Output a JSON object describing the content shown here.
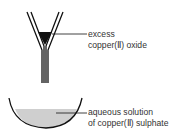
{
  "labels": {
    "oxide_line1": "excess",
    "oxide_line2": "copper(Ⅱ) oxide",
    "solution_line1": "aqueous solution",
    "solution_line2": "of copper(Ⅱ) sulphate"
  },
  "colors": {
    "line": "#111111",
    "solution": "#cfcfcf",
    "text": "#333333"
  }
}
